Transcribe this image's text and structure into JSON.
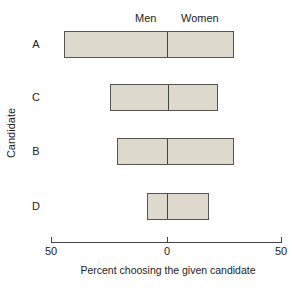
{
  "chart_data": {
    "type": "bar",
    "subtype": "diverging-horizontal",
    "title": "",
    "xlabel": "Percent choosing the given candidate",
    "ylabel": "Candidate",
    "categories": [
      "A",
      "C",
      "B",
      "D"
    ],
    "series": [
      {
        "name": "Men",
        "side": "left",
        "values": [
          45,
          25,
          22,
          9
        ]
      },
      {
        "name": "Women",
        "side": "right",
        "values": [
          29,
          22,
          29,
          18
        ]
      }
    ],
    "xticks": [
      "50",
      "0",
      "50"
    ],
    "xlim": [
      -50,
      50
    ],
    "grid": false,
    "legend": {
      "position": "top",
      "entries": [
        "Men",
        "Women"
      ]
    },
    "colors": {
      "bar_fill": "#ddd9cc",
      "bar_edge": "#555555"
    }
  },
  "labels": {
    "men": "Men",
    "women": "Women",
    "ylabel": "Candidate",
    "xlabel": "Percent choosing the given candidate",
    "tick_left": "50",
    "tick_mid": "0",
    "tick_right": "50",
    "cat0": "A",
    "cat1": "C",
    "cat2": "B",
    "cat3": "D"
  }
}
